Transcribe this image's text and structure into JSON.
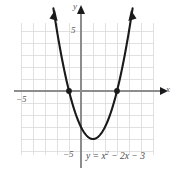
{
  "figure": {
    "kind": "cartesian-graph",
    "background_color": "#ffffff",
    "grid_color": "#d9d9d9",
    "axis_color": "#8c8c8c",
    "curve_color": "#1a1a1a",
    "label_color": "#5a5a5a",
    "equation_text": "y = x",
    "equation_exponent": "2",
    "equation_tail": " − 2x − 3"
  },
  "axis_labels": {
    "x_axis_name": "x",
    "y_axis_name": "y",
    "y_tick_positive": "5",
    "y_tick_negative": "−5",
    "x_tick_negative": "−5",
    "x_tick_positive": "5"
  },
  "chart_data": {
    "type": "line",
    "title": "",
    "xlabel": "x",
    "ylabel": "y",
    "xlim": [
      -5,
      6
    ],
    "ylim": [
      -6,
      6
    ],
    "grid": true,
    "grid_step": 1,
    "legend": "none",
    "equation": "y = x^2 - 2x - 3",
    "curve_shape": "parabola-opening-up",
    "vertex": [
      1,
      -4
    ],
    "roots": [
      -1,
      3
    ],
    "y_intercept": -3,
    "marked_points": [
      {
        "x": -1,
        "y": 0,
        "label": "root"
      },
      {
        "x": 3,
        "y": 0,
        "label": "root"
      }
    ],
    "arrowheads": [
      "left-branch-top",
      "right-branch-top",
      "x-axis-right",
      "y-axis-top"
    ],
    "x": [
      -2.3,
      -2.0,
      -1.5,
      -1.0,
      -0.5,
      0.0,
      0.5,
      1.0,
      1.5,
      2.0,
      2.5,
      3.0,
      3.5,
      4.0,
      4.3
    ],
    "values": [
      7.89,
      5.0,
      2.25,
      0.0,
      -1.75,
      -3.0,
      -3.75,
      -4.0,
      -3.75,
      -3.0,
      -1.75,
      0.0,
      2.25,
      5.0,
      6.89
    ]
  }
}
